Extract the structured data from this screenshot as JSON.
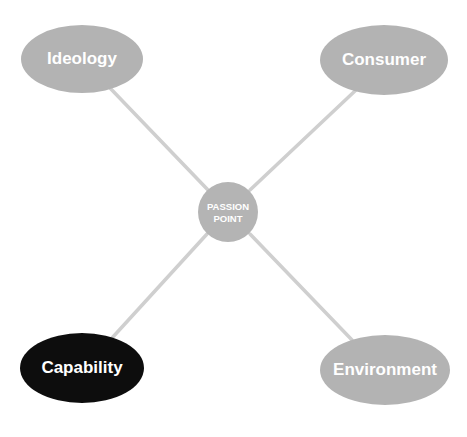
{
  "diagram": {
    "type": "hub-and-spoke",
    "center": {
      "line1": "PASSION",
      "line2": "POINT",
      "fill": "#b4b4b4"
    },
    "nodes": [
      {
        "id": "ideology",
        "label": "Ideology",
        "position": "top-left",
        "fill": "#b3b3b3",
        "highlighted": false
      },
      {
        "id": "consumer",
        "label": "Consumer",
        "position": "top-right",
        "fill": "#b3b3b3",
        "highlighted": false
      },
      {
        "id": "capability",
        "label": "Capability",
        "position": "bottom-left",
        "fill": "#0d0d0d",
        "highlighted": true
      },
      {
        "id": "environment",
        "label": "Environment",
        "position": "bottom-right",
        "fill": "#b3b3b3",
        "highlighted": false
      }
    ],
    "connector_color": "#cfcfcf"
  }
}
